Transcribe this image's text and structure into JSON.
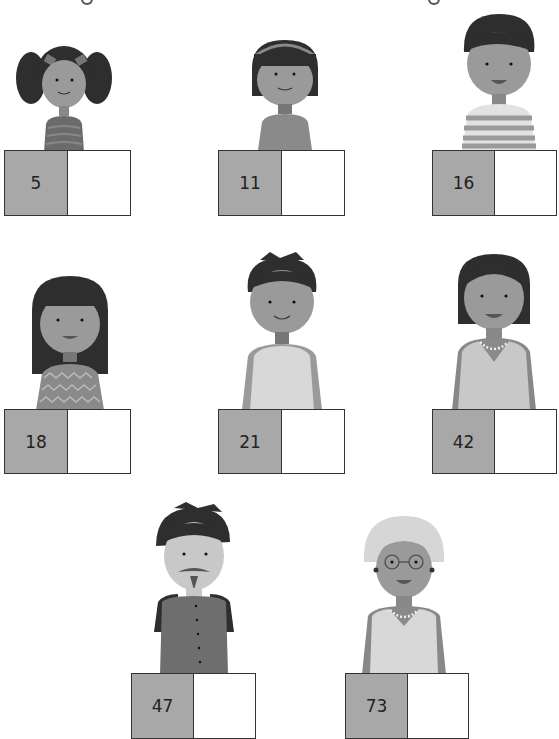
{
  "worksheet": {
    "people": [
      {
        "id": "girl-pigtails",
        "age": "5",
        "answer": ""
      },
      {
        "id": "girl-headband",
        "age": "11",
        "answer": ""
      },
      {
        "id": "boy-striped",
        "age": "16",
        "answer": ""
      },
      {
        "id": "girl-long-hair",
        "age": "18",
        "answer": ""
      },
      {
        "id": "young-man",
        "age": "21",
        "answer": ""
      },
      {
        "id": "woman-necklace",
        "age": "42",
        "answer": ""
      },
      {
        "id": "man-goatee",
        "age": "47",
        "answer": ""
      },
      {
        "id": "grandmother-glasses",
        "age": "73",
        "answer": ""
      }
    ]
  },
  "colors": {
    "age_cell": "#a8a8a8",
    "answer_cell": "#ffffff",
    "border": "#333333",
    "skin": "#9a9a9a",
    "hair": "#2e2e2e"
  }
}
